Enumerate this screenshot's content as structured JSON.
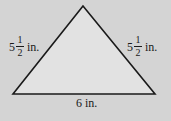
{
  "diagram": {
    "type": "triangle",
    "subtype": "isosceles",
    "colors": {
      "background": "#d4d4d4",
      "fill": "#e2e2e2",
      "stroke": "#1a1a1a",
      "text": "#1a1a1a"
    },
    "vertices": {
      "apex": [
        83,
        6
      ],
      "bottom_left": [
        13,
        94
      ],
      "bottom_right": [
        155,
        94
      ]
    },
    "labels": {
      "left_side": {
        "whole": "5",
        "numerator": "1",
        "denominator": "2",
        "unit": "in."
      },
      "right_side": {
        "whole": "5",
        "numerator": "1",
        "denominator": "2",
        "unit": "in."
      },
      "base": {
        "text": "6 in."
      }
    }
  }
}
